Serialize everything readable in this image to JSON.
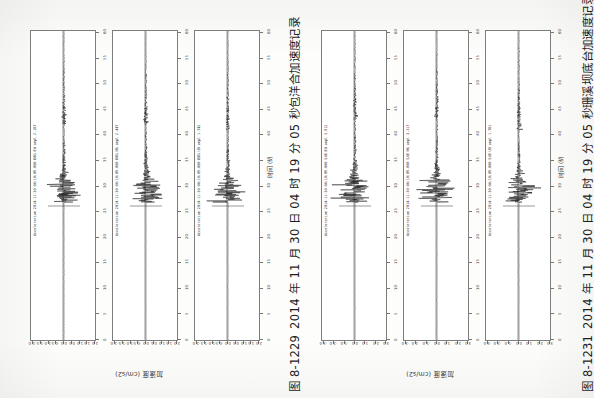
{
  "page": {
    "orientation": "rotated-90",
    "background_hex": "#fdfdfc",
    "ink_hex": "#1d1d1d"
  },
  "figures": [
    {
      "id": "figure-left",
      "number": "图 8-1229",
      "caption_text": "2014 年 11 月 30 日 04 时 19 分 05 秒包洋合加速度记录",
      "caption_full": "图 8-1229  2014 年 11 月 30 日 04 时 19 分 05 秒包洋合加速度记录",
      "time_axis_title": "时间 (s)",
      "accel_axis_title": "加速度 (cm/s2)",
      "panels": [
        {
          "channel_label": "Acceleration 2014-11-30 04:19:05.000 BBG EW  ampl  2.187",
          "peak_value": "2.187",
          "component": "EW"
        },
        {
          "channel_label": "Acceleration 2014-11-30 04:19:05.000 BBG NS  ampl  2.447",
          "peak_value": "2.447",
          "component": "NS"
        },
        {
          "channel_label": "Acceleration 2014-11-30 04:19:05.000 BBG UD  ampl  1.742",
          "peak_value": "1.742",
          "component": "UD"
        }
      ]
    },
    {
      "id": "figure-right",
      "number": "图 8-1231",
      "caption_text": "2014 年 11 月 30 日 04 时 19 分 05 秒珊溪坝底台加速度记录",
      "caption_full": "图 8-1231  2014 年 11 月 30 日 04 时 19 分 05 秒珊溪坝底台加速度记录",
      "time_axis_title": "时间 (s)",
      "accel_axis_title": "加速度 (cm/s2)",
      "panels": [
        {
          "channel_label": "Acceleration 2014-11-30 04:19:05.000 SXB EW  ampl  3.512",
          "peak_value": "3.512",
          "component": "EW"
        },
        {
          "channel_label": "Acceleration 2014-11-30 04:19:05.000 SXB NS  ampl  3.317",
          "peak_value": "3.317",
          "component": "NS"
        },
        {
          "channel_label": "Acceleration 2014-11-30 04:19:05.000 SXB UD  ampl  1.781",
          "peak_value": "1.781",
          "component": "UD"
        }
      ]
    }
  ],
  "chart_data": [
    {
      "type": "line",
      "title": "图 8-1229  2014 年 11 月 30 日 04 时 19 分 05 秒包洋合加速度记录",
      "xlabel": "时间 (s)",
      "ylabel": "加速度 (cm/s2)",
      "xlim": [
        0,
        60
      ],
      "ylim": [
        -2.5,
        2.5
      ],
      "grid": false,
      "legend": "none",
      "xticks": [
        0,
        5,
        10,
        15,
        20,
        25,
        30,
        35,
        40,
        45,
        50,
        55,
        60
      ],
      "yticks": [
        -2.0,
        -1.5,
        -1.0,
        -0.5,
        0.0,
        0.5,
        1.0,
        1.5,
        2.0
      ],
      "series": [
        {
          "name": "BBG EW",
          "peak_amplitude": 2.187,
          "onset_time_s": 27.0,
          "coda_end_s": 42.0
        },
        {
          "name": "BBG NS",
          "peak_amplitude": 2.447,
          "onset_time_s": 27.0,
          "coda_end_s": 42.0
        },
        {
          "name": "BBG UD",
          "peak_amplitude": 1.742,
          "onset_time_s": 27.0,
          "coda_end_s": 41.0
        }
      ]
    },
    {
      "type": "line",
      "title": "图 8-1231  2014 年 11 月 30 日 04 时 19 分 05 秒珊溪坝底台加速度记录",
      "xlabel": "时间 (s)",
      "ylabel": "加速度 (cm/s2)",
      "xlim": [
        0,
        60
      ],
      "ylim": [
        -3.5,
        3.5
      ],
      "grid": false,
      "legend": "none",
      "xticks": [
        0,
        5,
        10,
        15,
        20,
        25,
        30,
        35,
        40,
        45,
        50,
        55,
        60
      ],
      "yticks": [
        -3.0,
        -2.0,
        -1.0,
        0.0,
        1.0,
        2.0,
        3.0
      ],
      "series": [
        {
          "name": "SXB EW",
          "peak_amplitude": 3.512,
          "onset_time_s": 27.0,
          "coda_end_s": 43.0
        },
        {
          "name": "SXB NS",
          "peak_amplitude": 3.317,
          "onset_time_s": 27.0,
          "coda_end_s": 43.0
        },
        {
          "name": "SXB UD",
          "peak_amplitude": 1.781,
          "onset_time_s": 27.0,
          "coda_end_s": 41.0
        }
      ]
    }
  ],
  "axes": {
    "time_ticks": [
      "0",
      "5",
      "10",
      "15",
      "20",
      "25",
      "30",
      "35",
      "40",
      "45",
      "50",
      "55",
      "60"
    ],
    "accel_ticks_left": [
      "-2.0",
      "-1.5",
      "-1.0",
      "-0.5",
      "0.0",
      "0.5",
      "1.0",
      "1.5",
      "2.0"
    ],
    "accel_ticks_right": [
      "-3.0",
      "-2.0",
      "-1.0",
      "0.0",
      "1.0",
      "2.0",
      "3.0"
    ]
  }
}
